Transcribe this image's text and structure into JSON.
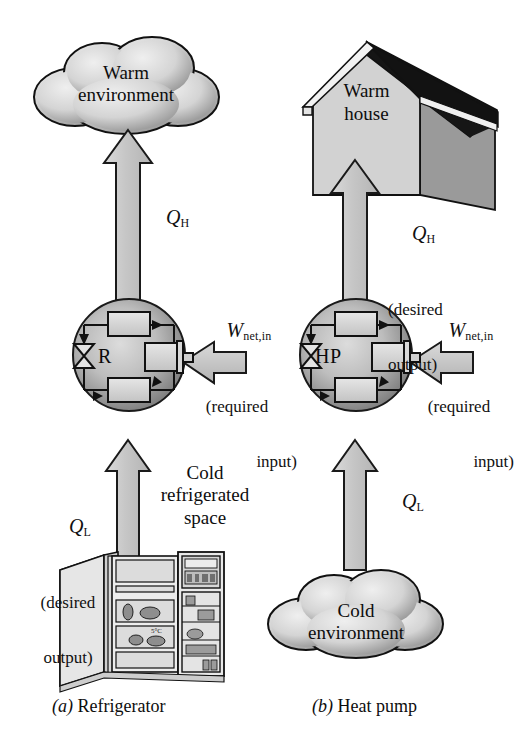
{
  "figure": {
    "type": "thermodynamic-cycle-diagram",
    "panels": [
      {
        "id": "a",
        "caption_letter": "(a)",
        "caption_text": "Refrigerator",
        "device_label": "R",
        "high_temp_reservoir": "Warm\nenvironment",
        "high_temp_reservoir_line1": "Warm",
        "high_temp_reservoir_line2": "environment",
        "low_temp_reservoir_line1": "Cold",
        "low_temp_reservoir_line2": "refrigerated",
        "low_temp_reservoir_line3": "space",
        "qh_symbol": "Q",
        "qh_sub": "H",
        "qh_note": "",
        "ql_symbol": "Q",
        "ql_sub": "L",
        "ql_note_line1": "(desired",
        "ql_note_line2": "output)",
        "w_symbol": "W",
        "w_sub": "net,in",
        "w_note_line1": "(required",
        "w_note_line2": "input)"
      },
      {
        "id": "b",
        "caption_letter": "(b)",
        "caption_text": "Heat pump",
        "device_label": "HP",
        "high_temp_reservoir_line1": "Warm",
        "high_temp_reservoir_line2": "house",
        "low_temp_reservoir_line1": "Cold",
        "low_temp_reservoir_line2": "environment",
        "qh_symbol": "Q",
        "qh_sub": "H",
        "qh_note_line1": "(desired",
        "qh_note_line2": "output)",
        "ql_symbol": "Q",
        "ql_sub": "L",
        "ql_note": "",
        "w_symbol": "W",
        "w_sub": "net,in",
        "w_note_line1": "(required",
        "w_note_line2": "input)"
      }
    ],
    "cycle_components": [
      "condenser",
      "expansion-valve",
      "compressor",
      "evaporator"
    ],
    "colors": {
      "arrow_fill": "#c9c9c9",
      "arrow_stroke": "#1a1a1a",
      "cloud_light": "#e8e8e8",
      "cloud_dark": "#8c8c8c",
      "circle_light": "#cfcfcf",
      "circle_dark": "#6f6f6f",
      "house_front": "#d2d2d2",
      "house_side": "#9a9a9a",
      "roof": "#151515",
      "fridge_body": "#dcdcdc",
      "line": "#111111"
    }
  }
}
